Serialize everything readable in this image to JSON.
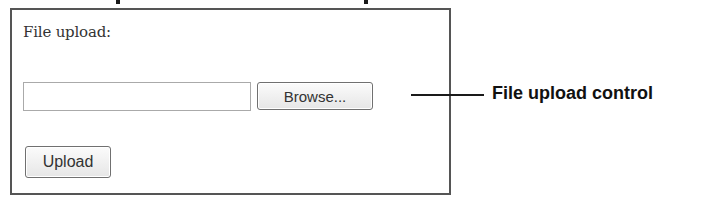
{
  "panel": {
    "label": "File upload:",
    "file_input": {
      "value": "",
      "placeholder": ""
    },
    "browse_button_label": "Browse...",
    "upload_button_label": "Upload"
  },
  "callout": {
    "label": "File upload control"
  },
  "colors": {
    "panel_border": "#555555",
    "text": "#333333",
    "callout_text": "#111111"
  }
}
